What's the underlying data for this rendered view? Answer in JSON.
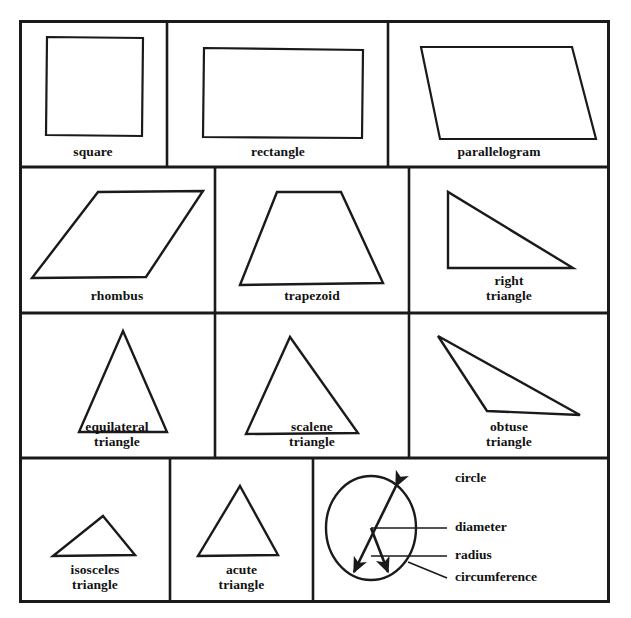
{
  "figure": {
    "kind": "geometric-shapes-reference-chart",
    "border_color": "#1a1a1a",
    "shape_stroke_color": "#1a1a1a",
    "background_color": "#ffffff"
  },
  "rows": [
    {
      "cells": [
        {
          "label": "square",
          "shape": "square"
        },
        {
          "label": "rectangle",
          "shape": "rectangle"
        },
        {
          "label": "parallelogram",
          "shape": "parallelogram"
        }
      ]
    },
    {
      "cells": [
        {
          "label": "rhombus",
          "shape": "rhombus"
        },
        {
          "label": "trapezoid",
          "shape": "trapezoid"
        },
        {
          "label": "right\ntriangle",
          "shape": "right-triangle"
        }
      ]
    },
    {
      "cells": [
        {
          "label": "equilateral\ntriangle",
          "shape": "equilateral-triangle"
        },
        {
          "label": "scalene\ntriangle",
          "shape": "scalene-triangle"
        },
        {
          "label": "obtuse\ntriangle",
          "shape": "obtuse-triangle"
        }
      ]
    },
    {
      "cells": [
        {
          "label": "isosceles\ntriangle",
          "shape": "isosceles-triangle"
        },
        {
          "label": "acute\ntriangle",
          "shape": "acute-triangle"
        },
        {
          "label": "",
          "shape": "circle-diagram"
        }
      ]
    }
  ],
  "circle_diagram": {
    "labels": {
      "circle": "circle",
      "diameter": "diameter",
      "radius": "radius",
      "circumference": "circumference"
    }
  }
}
